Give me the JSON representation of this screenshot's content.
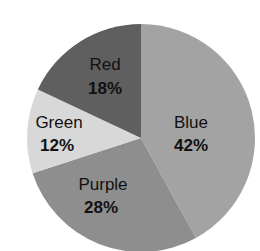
{
  "chart_data": {
    "type": "pie",
    "title": "",
    "categories": [
      "Blue",
      "Purple",
      "Green",
      "Red"
    ],
    "values": [
      42,
      28,
      12,
      18
    ],
    "unit": "%",
    "labels": [
      "42%",
      "28%",
      "12%",
      "18%"
    ],
    "colors": [
      "#a3a3a3",
      "#8e8e8e",
      "#d8d8d8",
      "#5f5f5f"
    ],
    "start_angle_deg": 0,
    "direction": "clockwise",
    "legend": "none (labels inside slices)"
  },
  "slices": [
    {
      "name": "Blue",
      "pct": "42%",
      "value": 42,
      "color": "#a3a3a3"
    },
    {
      "name": "Purple",
      "pct": "28%",
      "value": 28,
      "color": "#8e8e8e"
    },
    {
      "name": "Green",
      "pct": "12%",
      "value": 12,
      "color": "#d8d8d8"
    },
    {
      "name": "Red",
      "pct": "18%",
      "value": 18,
      "color": "#5f5f5f"
    }
  ]
}
